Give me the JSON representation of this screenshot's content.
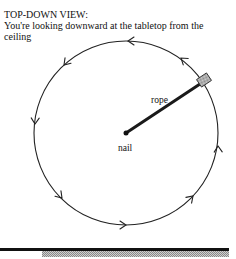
{
  "header": {
    "title": "TOP-DOWN VIEW:",
    "subtitle": "You're looking downward at the tabletop from the ceiling"
  },
  "diagram": {
    "labels": {
      "rope": "rope",
      "nail": "nail"
    },
    "circle": {
      "cx": 126,
      "cy": 133,
      "r": 92,
      "direction": "counterclockwise"
    },
    "colors": {
      "line": "#222222",
      "block_fill": "#bdbdbd",
      "floor_line": "#111111",
      "floor_hatch": "#9a9a9a"
    }
  }
}
